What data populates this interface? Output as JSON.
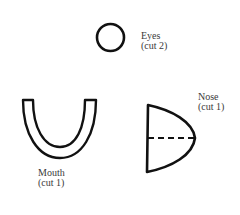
{
  "diagram": {
    "pieces": [
      {
        "id": "eyes",
        "name": "Eyes",
        "cut": "(cut 2)",
        "shape": "circle"
      },
      {
        "id": "mouth",
        "name": "Mouth",
        "cut": "(cut 1)",
        "shape": "u-shape"
      },
      {
        "id": "nose",
        "name": "Nose",
        "cut": "(cut 1)",
        "shape": "half-dome-with-fold-line"
      }
    ],
    "colors": {
      "stroke": "#111111",
      "text": "#3a3a3a",
      "background": "#ffffff"
    }
  }
}
